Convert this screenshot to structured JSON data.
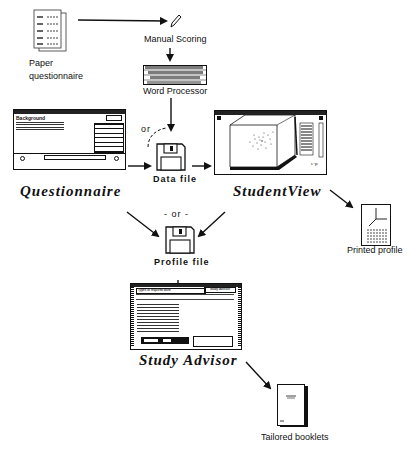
{
  "diagram": {
    "nodes": {
      "paper_questionnaire": {
        "label_line1": "Paper",
        "label_line2": "questionnaire",
        "icon": "paper-stack-icon"
      },
      "manual_scoring": {
        "label": "Manual Scoring",
        "icon": "pencil-icon"
      },
      "word_processor": {
        "label": "Word Processor",
        "icon": "keyboard-icon"
      },
      "questionnaire": {
        "label": "Questionnaire",
        "icon": "questionnaire-window-icon",
        "window_title": "Background"
      },
      "data_file": {
        "label": "Data  file",
        "icon": "floppy-disk-icon"
      },
      "studentview": {
        "label": "StudentView",
        "icon": "3d-scatter-window-icon"
      },
      "printed_profile": {
        "label": "Printed  profile",
        "icon": "printed-chart-icon"
      },
      "profile_file": {
        "label": "Profile  file",
        "icon": "floppy-disk-icon"
      },
      "study_advisor": {
        "label": "Study  Advisor",
        "icon": "advisor-window-icon",
        "window_title": "Types of required work",
        "window_button": "Study Advisor"
      },
      "tailored_booklets": {
        "label": "Tailored  booklets",
        "icon": "booklet-icon"
      }
    },
    "or_labels": {
      "top": "or",
      "middle": "- or -"
    },
    "edges": [
      {
        "from": "Paper questionnaire",
        "to": "Manual Scoring"
      },
      {
        "from": "Manual Scoring",
        "to": "Word Processor"
      },
      {
        "from": "Word Processor",
        "to": "Data file"
      },
      {
        "from": "Questionnaire",
        "to": "Data file",
        "style": "dashed-or"
      },
      {
        "from": "Questionnaire",
        "to": "Data file"
      },
      {
        "from": "Data file",
        "to": "StudentView"
      },
      {
        "from": "StudentView",
        "to": "Printed profile"
      },
      {
        "from": "Questionnaire",
        "to": "Profile file"
      },
      {
        "from": "StudentView",
        "to": "Profile file"
      },
      {
        "from": "Profile file",
        "to": "Study Advisor"
      },
      {
        "from": "Study Advisor",
        "to": "Tailored booklets"
      }
    ]
  }
}
